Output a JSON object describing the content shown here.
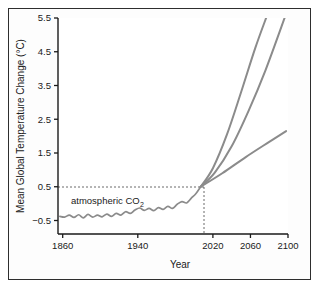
{
  "chart_data": {
    "type": "line",
    "title": "",
    "xlabel": "Year",
    "ylabel": "Mean Global Temperature Change (°C)",
    "xlim": [
      1855,
      2100
    ],
    "ylim": [
      -0.9,
      5.5
    ],
    "grid": false,
    "legend_position": "none",
    "xticks": [
      1860,
      1940,
      2020,
      2060,
      2100
    ],
    "xtick_labels": [
      "1860",
      "1940",
      "2020",
      "2060",
      "2100"
    ],
    "yticks": [
      -0.5,
      0.5,
      1.5,
      2.5,
      3.5,
      4.5,
      5.5
    ],
    "ytick_labels": [
      "−0.5",
      "0.5",
      "1.5",
      "2.5",
      "3.5",
      "4.5",
      "5.5"
    ],
    "annotations": [
      {
        "text": "atmospheric CO",
        "subscript": "2",
        "x": 1870,
        "y": 0.18
      }
    ],
    "reference_lines": [
      {
        "orientation": "horizontal",
        "value": 0.5,
        "style": "dashed",
        "from_x": 1855,
        "to_x": 2007
      },
      {
        "orientation": "vertical",
        "value": 2007,
        "style": "dashed",
        "from_y": -0.9,
        "to_y": 0.5
      }
    ],
    "series": [
      {
        "name": "observed-record",
        "kind": "historical",
        "color": "#8b8b8b",
        "x": [
          1857,
          1862,
          1867,
          1872,
          1877,
          1882,
          1887,
          1892,
          1897,
          1902,
          1907,
          1912,
          1917,
          1922,
          1927,
          1932,
          1937,
          1942,
          1947,
          1952,
          1957,
          1962,
          1967,
          1972,
          1977,
          1982,
          1987,
          1992,
          1997,
          2002,
          2007
        ],
        "y": [
          -0.38,
          -0.4,
          -0.34,
          -0.41,
          -0.33,
          -0.42,
          -0.32,
          -0.4,
          -0.34,
          -0.39,
          -0.31,
          -0.38,
          -0.29,
          -0.34,
          -0.24,
          -0.29,
          -0.19,
          -0.13,
          -0.2,
          -0.14,
          -0.21,
          -0.12,
          -0.17,
          -0.08,
          -0.14,
          -0.02,
          0.06,
          0.02,
          0.16,
          0.3,
          0.5
        ]
      },
      {
        "name": "high-emissions-projection",
        "kind": "projection",
        "color": "#8b8b8b",
        "x": [
          2007,
          2020,
          2035,
          2050,
          2065,
          2078
        ],
        "y": [
          0.5,
          1.05,
          2.05,
          3.3,
          4.6,
          5.6
        ]
      },
      {
        "name": "mid-emissions-projection",
        "kind": "projection",
        "color": "#8b8b8b",
        "x": [
          2007,
          2022,
          2040,
          2058,
          2076,
          2097
        ],
        "y": [
          0.5,
          0.92,
          1.7,
          2.75,
          3.95,
          5.55
        ]
      },
      {
        "name": "low-emissions-projection",
        "kind": "projection",
        "color": "#8b8b8b",
        "x": [
          2007,
          2030,
          2055,
          2080,
          2098
        ],
        "y": [
          0.5,
          0.9,
          1.38,
          1.83,
          2.15
        ]
      }
    ]
  }
}
